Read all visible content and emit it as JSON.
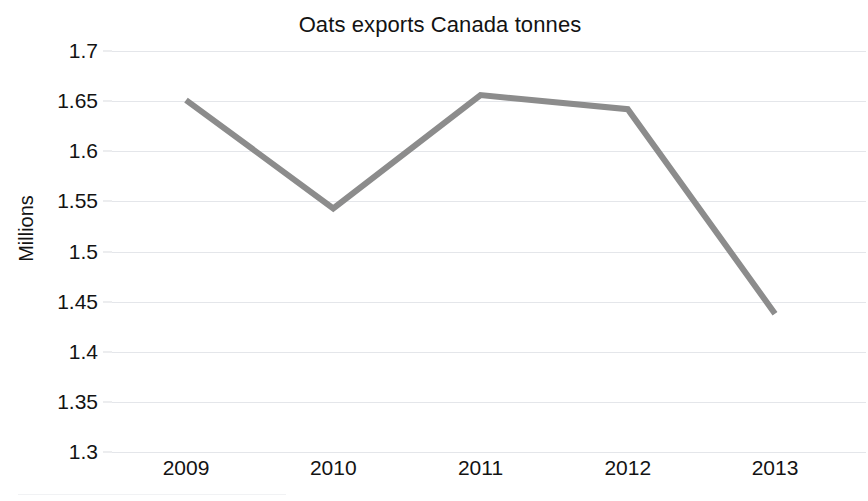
{
  "chart_data": {
    "type": "line",
    "title": "Oats exports Canada tonnes",
    "xlabel": "",
    "ylabel": "Millions",
    "categories": [
      "2009",
      "2010",
      "2011",
      "2012",
      "2013"
    ],
    "x": [
      2009,
      2010,
      2011,
      2012,
      2013
    ],
    "values": [
      1.651,
      1.543,
      1.656,
      1.642,
      1.438
    ],
    "series": [
      {
        "name": "Oats exports Canada tonnes",
        "values": [
          1.651,
          1.543,
          1.656,
          1.642,
          1.438
        ],
        "color": "#8c8c8c"
      }
    ],
    "ylim": [
      1.3,
      1.7
    ],
    "ytick_labels": [
      "1.7",
      "1.65",
      "1.6",
      "1.55",
      "1.5",
      "1.45",
      "1.4",
      "1.35",
      "1.3"
    ],
    "ytick_values": [
      1.7,
      1.65,
      1.6,
      1.55,
      1.5,
      1.45,
      1.4,
      1.35,
      1.3
    ],
    "grid": true,
    "grid_axis": "y",
    "legend": false,
    "legend_position": "none",
    "markers": false,
    "line_width": 6,
    "colors": {
      "series_line": "#8c8c8c",
      "gridline": "#e4e6ea",
      "text": "#131313",
      "background": "#ffffff"
    }
  }
}
